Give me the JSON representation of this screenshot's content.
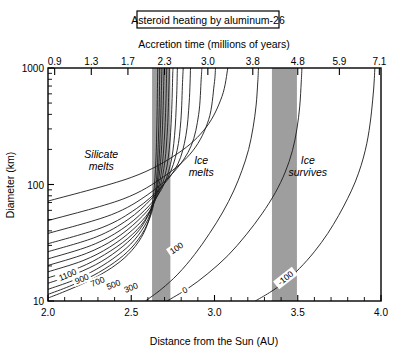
{
  "figure": {
    "title": "Asteroid heating by aluminum-26",
    "top_axis_label": "Accretion time (millions of years)",
    "bottom_axis_label": "Distance from the Sun (AU)",
    "left_axis_label": "Diameter (km)"
  },
  "chart_data": {
    "type": "line",
    "title": "Asteroid heating by aluminum-26",
    "xlabel": "Distance from the Sun (AU)",
    "ylabel": "Diameter (km)",
    "x2label": "Accretion time (millions of years)",
    "xlim": [
      2.0,
      4.0
    ],
    "ylim": [
      10,
      1000
    ],
    "yscale": "log",
    "xscale": "linear",
    "grid": false,
    "legend": null,
    "x_ticks": [
      "2.0",
      "2.5",
      "3.0",
      "3.5",
      "4.0"
    ],
    "x_tick_values": [
      2.0,
      2.5,
      3.0,
      3.5,
      4.0
    ],
    "x_minor_tick_values": [
      2.1,
      2.2,
      2.3,
      2.4,
      2.6,
      2.7,
      2.8,
      2.9,
      3.1,
      3.2,
      3.3,
      3.4,
      3.6,
      3.7,
      3.8,
      3.9
    ],
    "y_ticks": [
      "10",
      "100",
      "1000"
    ],
    "y_tick_values": [
      10,
      100,
      1000
    ],
    "top_ticks": [
      "0.9",
      "1.3",
      "1.7",
      "2.3",
      "3.0",
      "3.8",
      "4.8",
      "5.9",
      "7.1"
    ],
    "top_tick_values": [
      0.9,
      1.3,
      1.7,
      2.3,
      3.0,
      3.8,
      4.8,
      5.9,
      7.1
    ],
    "top_tick_positions_au": [
      2.04,
      2.26,
      2.48,
      2.7,
      2.96,
      3.23,
      3.5,
      3.75,
      3.99
    ],
    "annotations": [
      {
        "text": "Silicate melts",
        "x": 2.32,
        "y": 170
      },
      {
        "text": "Ice melts",
        "x": 2.92,
        "y": 150
      },
      {
        "text": "Ice survives",
        "x": 3.56,
        "y": 150
      }
    ],
    "shaded_bands": [
      {
        "label": "band-1",
        "x_start": 2.625,
        "x_end": 2.735,
        "color": "#9e9e9e"
      },
      {
        "label": "band-2",
        "x_start": 3.345,
        "x_end": 3.495,
        "color": "#9e9e9e"
      }
    ],
    "contour_labels": [
      {
        "value": "1100",
        "x": 2.12,
        "y": 16.5
      },
      {
        "value": "900",
        "x": 2.205,
        "y": 15.2
      },
      {
        "value": "700",
        "x": 2.3,
        "y": 14.4
      },
      {
        "value": "500",
        "x": 2.395,
        "y": 13.6
      },
      {
        "value": "300",
        "x": 2.5,
        "y": 12.8
      },
      {
        "value": "100",
        "x": 2.775,
        "y": 28
      },
      {
        "value": "0",
        "x": 2.825,
        "y": 12.2
      },
      {
        "value": "-100",
        "x": 3.43,
        "y": 15.5
      }
    ],
    "series": [
      {
        "name": "1600",
        "points": [
          [
            2.0,
            10.6
          ],
          [
            2.12,
            12.4
          ],
          [
            2.25,
            15.0
          ],
          [
            2.38,
            19.2
          ],
          [
            2.48,
            25.0
          ],
          [
            2.56,
            35
          ],
          [
            2.61,
            52
          ],
          [
            2.635,
            85
          ],
          [
            2.648,
            160
          ],
          [
            2.654,
            330
          ],
          [
            2.657,
            620
          ],
          [
            2.659,
            1000
          ]
        ]
      },
      {
        "name": "1500",
        "points": [
          [
            2.0,
            11.4
          ],
          [
            2.13,
            13.4
          ],
          [
            2.27,
            16.5
          ],
          [
            2.4,
            21.5
          ],
          [
            2.5,
            28.5
          ],
          [
            2.58,
            41
          ],
          [
            2.63,
            63
          ],
          [
            2.652,
            110
          ],
          [
            2.662,
            220
          ],
          [
            2.668,
            460
          ],
          [
            2.671,
            1000
          ]
        ]
      },
      {
        "name": "1300",
        "points": [
          [
            2.0,
            12.6
          ],
          [
            2.15,
            15.0
          ],
          [
            2.29,
            18.7
          ],
          [
            2.42,
            24.8
          ],
          [
            2.52,
            33.5
          ],
          [
            2.6,
            50
          ],
          [
            2.645,
            80
          ],
          [
            2.665,
            145
          ],
          [
            2.675,
            300
          ],
          [
            2.681,
            640
          ],
          [
            2.684,
            1000
          ]
        ]
      },
      {
        "name": "1100",
        "points": [
          [
            2.0,
            14.2
          ],
          [
            2.17,
            17.2
          ],
          [
            2.32,
            21.8
          ],
          [
            2.45,
            29.5
          ],
          [
            2.55,
            41
          ],
          [
            2.62,
            62
          ],
          [
            2.66,
            100
          ],
          [
            2.68,
            185
          ],
          [
            2.69,
            390
          ],
          [
            2.696,
            820
          ],
          [
            2.698,
            1000
          ]
        ]
      },
      {
        "name": "1000",
        "points": [
          [
            2.0,
            15.8
          ],
          [
            2.19,
            19.4
          ],
          [
            2.34,
            25.0
          ],
          [
            2.48,
            34.5
          ],
          [
            2.58,
            49
          ],
          [
            2.645,
            76
          ],
          [
            2.68,
            125
          ],
          [
            2.698,
            235
          ],
          [
            2.708,
            500
          ],
          [
            2.713,
            1000
          ]
        ]
      },
      {
        "name": "900",
        "points": [
          [
            2.0,
            17.8
          ],
          [
            2.21,
            22.2
          ],
          [
            2.37,
            29.0
          ],
          [
            2.51,
            41
          ],
          [
            2.61,
            59
          ],
          [
            2.67,
            93
          ],
          [
            2.702,
            158
          ],
          [
            2.718,
            310
          ],
          [
            2.726,
            660
          ],
          [
            2.729,
            1000
          ]
        ]
      },
      {
        "name": "800",
        "points": [
          [
            2.0,
            20.2
          ],
          [
            2.23,
            25.6
          ],
          [
            2.4,
            34.0
          ],
          [
            2.54,
            49
          ],
          [
            2.64,
            72
          ],
          [
            2.7,
            116
          ],
          [
            2.728,
            200
          ],
          [
            2.742,
            400
          ],
          [
            2.749,
            870
          ],
          [
            2.751,
            1000
          ]
        ]
      },
      {
        "name": "700",
        "points": [
          [
            2.0,
            23.0
          ],
          [
            2.26,
            30.0
          ],
          [
            2.44,
            41
          ],
          [
            2.58,
            60
          ],
          [
            2.68,
            90
          ],
          [
            2.735,
            148
          ],
          [
            2.76,
            262
          ],
          [
            2.772,
            540
          ],
          [
            2.777,
            1000
          ]
        ]
      },
      {
        "name": "600",
        "points": [
          [
            2.0,
            26.5
          ],
          [
            2.29,
            35.5
          ],
          [
            2.48,
            50
          ],
          [
            2.62,
            75
          ],
          [
            2.72,
            115
          ],
          [
            2.775,
            195
          ],
          [
            2.798,
            355
          ],
          [
            2.808,
            750
          ],
          [
            2.812,
            1000
          ]
        ]
      },
      {
        "name": "500",
        "points": [
          [
            2.0,
            31.0
          ],
          [
            2.33,
            43
          ],
          [
            2.53,
            62
          ],
          [
            2.68,
            95
          ],
          [
            2.78,
            150
          ],
          [
            2.828,
            262
          ],
          [
            2.848,
            510
          ],
          [
            2.856,
            1000
          ]
        ]
      },
      {
        "name": "300",
        "points": [
          [
            2.0,
            38
          ],
          [
            2.38,
            55
          ],
          [
            2.6,
            82
          ],
          [
            2.76,
            130
          ],
          [
            2.86,
            215
          ],
          [
            2.905,
            400
          ],
          [
            2.92,
            800
          ],
          [
            2.924,
            1000
          ]
        ]
      },
      {
        "name": "100",
        "points": [
          [
            2.0,
            49
          ],
          [
            2.45,
            75
          ],
          [
            2.7,
            118
          ],
          [
            2.87,
            195
          ],
          [
            2.965,
            360
          ],
          [
            2.998,
            720
          ],
          [
            3.006,
            1000
          ]
        ]
      },
      {
        "name": "0-upper",
        "points": [
          [
            2.0,
            72
          ],
          [
            2.5,
            115
          ],
          [
            2.78,
            185
          ],
          [
            2.95,
            310
          ],
          [
            3.045,
            570
          ],
          [
            3.08,
            1000
          ]
        ]
      },
      {
        "name": "100-lower",
        "points": [
          [
            2.585,
            10
          ],
          [
            2.68,
            12.6
          ],
          [
            2.78,
            17.0
          ],
          [
            2.88,
            25.0
          ],
          [
            2.97,
            38
          ],
          [
            3.05,
            58
          ],
          [
            3.115,
            88
          ],
          [
            3.165,
            132
          ],
          [
            3.205,
            200
          ],
          [
            3.232,
            310
          ],
          [
            3.25,
            480
          ],
          [
            3.26,
            760
          ],
          [
            3.264,
            1000
          ]
        ]
      },
      {
        "name": "0-lower",
        "points": [
          [
            2.715,
            10
          ],
          [
            2.84,
            12.8
          ],
          [
            2.96,
            17.2
          ],
          [
            3.08,
            24.5
          ],
          [
            3.19,
            37
          ],
          [
            3.285,
            56
          ],
          [
            3.365,
            85
          ],
          [
            3.425,
            128
          ],
          [
            3.468,
            195
          ],
          [
            3.495,
            300
          ],
          [
            3.512,
            470
          ],
          [
            3.521,
            760
          ],
          [
            3.525,
            1000
          ]
        ]
      },
      {
        "name": "-100",
        "points": [
          [
            3.245,
            10
          ],
          [
            3.33,
            11.8
          ],
          [
            3.42,
            14.5
          ],
          [
            3.51,
            19.0
          ],
          [
            3.6,
            26.5
          ],
          [
            3.68,
            38
          ],
          [
            3.745,
            54
          ],
          [
            3.8,
            76
          ],
          [
            3.845,
            105
          ],
          [
            3.88,
            145
          ],
          [
            3.905,
            195
          ],
          [
            3.922,
            255
          ],
          [
            3.934,
            330
          ],
          [
            3.943,
            420
          ],
          [
            3.95,
            530
          ],
          [
            3.956,
            660
          ],
          [
            3.96,
            810
          ],
          [
            3.963,
            1000
          ]
        ]
      }
    ]
  }
}
